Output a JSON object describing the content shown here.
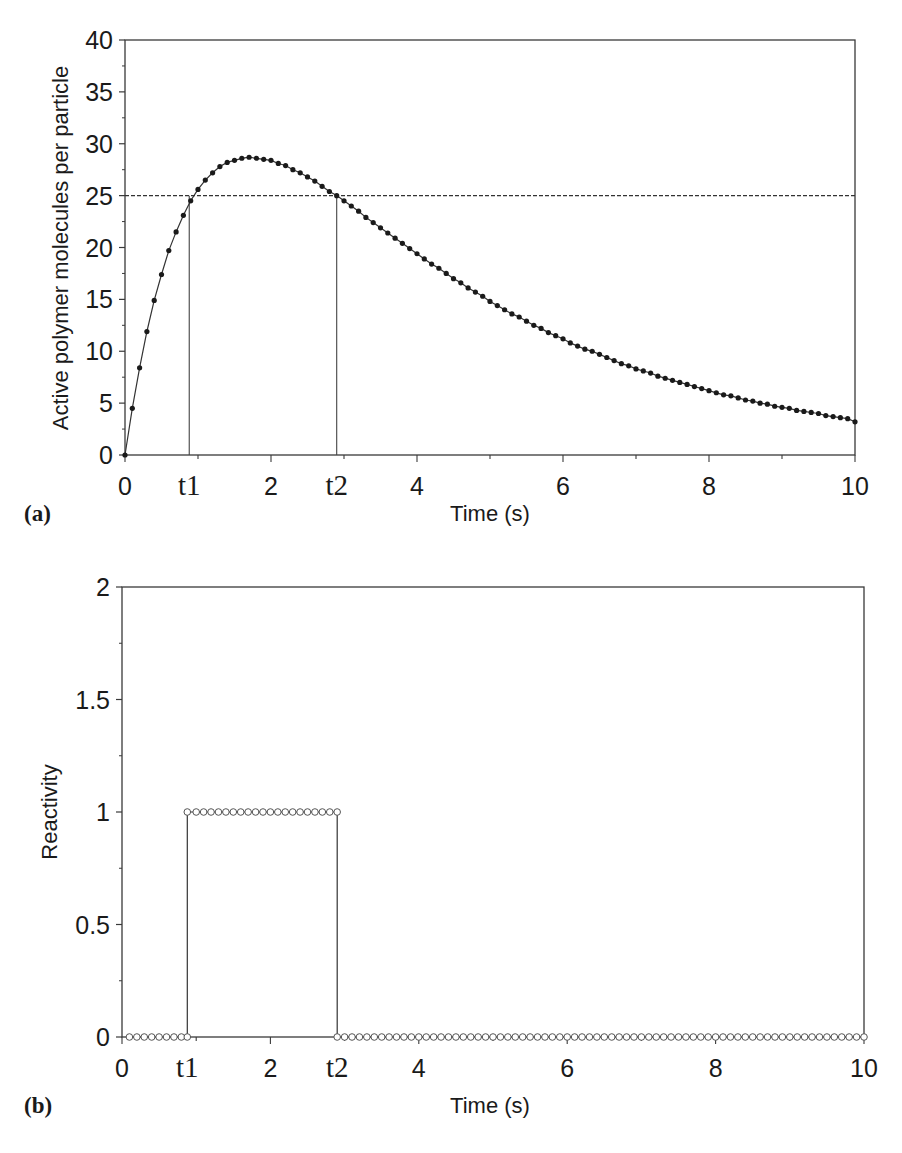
{
  "chart_data": [
    {
      "panel": "(a)",
      "type": "line",
      "title": "",
      "xlabel": "Time (s)",
      "ylabel": "Active polymer molecules per particle",
      "xlim": [
        0,
        10
      ],
      "ylim": [
        0,
        40
      ],
      "x_ticks": [
        "0",
        "t1",
        "2",
        "t2",
        "4",
        "6",
        "8",
        "10"
      ],
      "x_tick_positions": [
        0,
        0.88,
        2,
        2.9,
        4,
        6,
        8,
        10
      ],
      "y_ticks": [
        "0",
        "5",
        "10",
        "15",
        "20",
        "25",
        "30",
        "35",
        "40"
      ],
      "grid": false,
      "legend": null,
      "annotations": [
        {
          "type": "hline",
          "y": 25,
          "style": "dashed"
        },
        {
          "type": "vline",
          "x": 0.88,
          "label": "t1",
          "from_y": 0,
          "to_y": 25
        },
        {
          "type": "vline",
          "x": 2.9,
          "label": "t2",
          "from_y": 0,
          "to_y": 25
        }
      ],
      "series": [
        {
          "name": "Active polymer molecules",
          "marker": "filled-circle",
          "x": [
            0,
            0.1,
            0.2,
            0.3,
            0.4,
            0.5,
            0.6,
            0.7,
            0.8,
            0.9,
            1.0,
            1.1,
            1.2,
            1.3,
            1.4,
            1.5,
            1.6,
            1.7,
            1.8,
            1.9,
            2.0,
            2.1,
            2.2,
            2.3,
            2.4,
            2.5,
            2.6,
            2.7,
            2.8,
            2.9,
            3.0,
            3.1,
            3.2,
            3.3,
            3.4,
            3.5,
            3.6,
            3.7,
            3.8,
            3.9,
            4.0,
            4.1,
            4.2,
            4.3,
            4.4,
            4.5,
            4.6,
            4.7,
            4.8,
            4.9,
            5.0,
            5.1,
            5.2,
            5.3,
            5.4,
            5.5,
            5.6,
            5.7,
            5.8,
            5.9,
            6.0,
            6.1,
            6.2,
            6.3,
            6.4,
            6.5,
            6.6,
            6.7,
            6.8,
            6.9,
            7.0,
            7.1,
            7.2,
            7.3,
            7.4,
            7.5,
            7.6,
            7.7,
            7.8,
            7.9,
            8.0,
            8.1,
            8.2,
            8.3,
            8.4,
            8.5,
            8.6,
            8.7,
            8.8,
            8.9,
            9.0,
            9.1,
            9.2,
            9.3,
            9.4,
            9.5,
            9.6,
            9.7,
            9.8,
            9.9,
            10.0
          ],
          "values": [
            0,
            4.5,
            8.4,
            11.9,
            14.9,
            17.4,
            19.7,
            21.5,
            23.1,
            24.5,
            25.6,
            26.5,
            27.2,
            27.8,
            28.2,
            28.4,
            28.6,
            28.7,
            28.6,
            28.5,
            28.4,
            28.1,
            27.9,
            27.5,
            27.2,
            26.8,
            26.4,
            25.9,
            25.4,
            25.0,
            24.5,
            24.0,
            23.5,
            22.9,
            22.4,
            21.9,
            21.4,
            20.9,
            20.4,
            19.9,
            19.4,
            18.9,
            18.4,
            18.0,
            17.5,
            17.0,
            16.6,
            16.1,
            15.7,
            15.3,
            14.8,
            14.4,
            14.0,
            13.6,
            13.3,
            12.9,
            12.5,
            12.2,
            11.8,
            11.5,
            11.2,
            10.8,
            10.5,
            10.2,
            10.0,
            9.7,
            9.4,
            9.1,
            8.8,
            8.6,
            8.3,
            8.1,
            7.9,
            7.6,
            7.4,
            7.2,
            7.0,
            6.8,
            6.6,
            6.4,
            6.2,
            6.0,
            5.8,
            5.7,
            5.5,
            5.3,
            5.2,
            5.0,
            4.9,
            4.7,
            4.6,
            4.5,
            4.3,
            4.2,
            4.1,
            4.0,
            3.8,
            3.7,
            3.6,
            3.5,
            3.2
          ]
        }
      ]
    },
    {
      "panel": "(b)",
      "type": "line",
      "title": "",
      "xlabel": "Time (s)",
      "ylabel": "Reactivity",
      "xlim": [
        0,
        10
      ],
      "ylim": [
        0,
        2
      ],
      "x_ticks": [
        "0",
        "t1",
        "2",
        "t2",
        "4",
        "6",
        "8",
        "10"
      ],
      "x_tick_positions": [
        0,
        0.88,
        2,
        2.9,
        4,
        6,
        8,
        10
      ],
      "y_ticks": [
        "0",
        "0.5",
        "1",
        "1.5",
        "2"
      ],
      "grid": false,
      "legend": null,
      "series": [
        {
          "name": "Reactivity",
          "marker": "open-circle",
          "step": true,
          "x": [
            0.1,
            0.2,
            0.3,
            0.4,
            0.5,
            0.6,
            0.7,
            0.8,
            0.88,
            0.88,
            1.0,
            1.1,
            1.2,
            1.3,
            1.4,
            1.5,
            1.6,
            1.7,
            1.8,
            1.9,
            2.0,
            2.1,
            2.2,
            2.3,
            2.4,
            2.5,
            2.6,
            2.7,
            2.8,
            2.9,
            2.9,
            3.0,
            3.1,
            3.2,
            3.3,
            3.4,
            3.5,
            3.6,
            3.7,
            3.8,
            3.9,
            4.0,
            4.1,
            4.2,
            4.3,
            4.4,
            4.5,
            4.6,
            4.7,
            4.8,
            4.9,
            5.0,
            5.1,
            5.2,
            5.3,
            5.4,
            5.5,
            5.6,
            5.7,
            5.8,
            5.9,
            6.0,
            6.1,
            6.2,
            6.3,
            6.4,
            6.5,
            6.6,
            6.7,
            6.8,
            6.9,
            7.0,
            7.1,
            7.2,
            7.3,
            7.4,
            7.5,
            7.6,
            7.7,
            7.8,
            7.9,
            8.0,
            8.1,
            8.2,
            8.3,
            8.4,
            8.5,
            8.6,
            8.7,
            8.8,
            8.9,
            9.0,
            9.1,
            9.2,
            9.3,
            9.4,
            9.5,
            9.6,
            9.7,
            9.8,
            9.9,
            10.0
          ],
          "values": [
            0,
            0,
            0,
            0,
            0,
            0,
            0,
            0,
            0,
            1,
            1,
            1,
            1,
            1,
            1,
            1,
            1,
            1,
            1,
            1,
            1,
            1,
            1,
            1,
            1,
            1,
            1,
            1,
            1,
            1,
            0,
            0,
            0,
            0,
            0,
            0,
            0,
            0,
            0,
            0,
            0,
            0,
            0,
            0,
            0,
            0,
            0,
            0,
            0,
            0,
            0,
            0,
            0,
            0,
            0,
            0,
            0,
            0,
            0,
            0,
            0,
            0,
            0,
            0,
            0,
            0,
            0,
            0,
            0,
            0,
            0,
            0,
            0,
            0,
            0,
            0,
            0,
            0,
            0,
            0,
            0,
            0,
            0,
            0,
            0,
            0,
            0,
            0,
            0,
            0,
            0,
            0,
            0,
            0,
            0,
            0,
            0,
            0,
            0,
            0,
            0,
            0
          ]
        }
      ]
    }
  ],
  "panels": {
    "a": {
      "label": "(a)",
      "xlabel": "Time (s)",
      "ylabel": "Active polymer molecules per particle"
    },
    "b": {
      "label": "(b)",
      "xlabel": "Time (s)",
      "ylabel": "Reactivity"
    }
  }
}
